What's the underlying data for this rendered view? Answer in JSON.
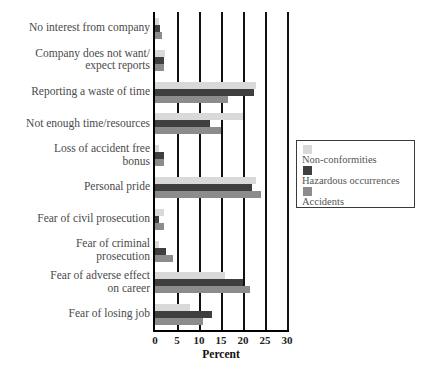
{
  "chart_data": {
    "type": "bar",
    "orientation": "horizontal",
    "title": "",
    "xlabel": "Percent",
    "ylabel": "",
    "xlim": [
      0,
      30
    ],
    "xticks": [
      0,
      5,
      10,
      15,
      20,
      25,
      30
    ],
    "grid": true,
    "legend_position": "right",
    "categories": [
      "No interest from company",
      "Company does not want/\nexpect reports",
      "Reporting a waste of time",
      "Not enough time/resources",
      "Loss of accident free\nbonus",
      "Personal pride",
      "Fear of civil prosecution",
      "Fear of criminal\nprosecution",
      "Fear of adverse effect\non career",
      "Fear of losing job"
    ],
    "series": [
      {
        "name": "Non-conformities",
        "color": "#d9d9d9",
        "values": [
          1,
          2.2,
          23,
          20,
          1,
          23,
          2,
          1,
          16,
          8
        ]
      },
      {
        "name": "Hazardous occurrences",
        "color": "#3f3f3f",
        "values": [
          1.2,
          2,
          22.5,
          12.5,
          2,
          22,
          1,
          2.5,
          20,
          13
        ]
      },
      {
        "name": "Accidents",
        "color": "#8c8c8c",
        "values": [
          1.5,
          2,
          16.5,
          15,
          2,
          24,
          2,
          4,
          21.5,
          11
        ]
      }
    ]
  },
  "legend": {
    "items": [
      {
        "label": "Non-conformities",
        "swatch": "light-gray-swatch"
      },
      {
        "label": "Hazardous occurrences",
        "swatch": "dark-gray-swatch"
      },
      {
        "label": "Accidents",
        "swatch": "medium-gray-swatch"
      }
    ]
  }
}
